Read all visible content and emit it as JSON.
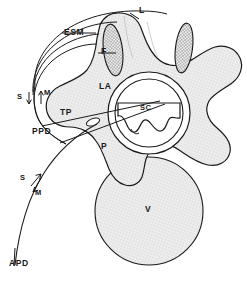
{
  "figure": {
    "type": "anatomical-line-diagram",
    "background_color": "#ffffff",
    "line_color": "#1a1a1a",
    "bone_fill": "#e9e9e9",
    "facet_fill": "#e0e0e0",
    "vertebral_body_fill": "#ebebeb"
  },
  "labels": {
    "esm": "ESM",
    "f": "F",
    "l": "L",
    "la": "LA",
    "tp": "TP",
    "ppd": "PPD",
    "p": "P",
    "sc": "SC",
    "v": "V",
    "apd": "APD",
    "s_upper": "S",
    "m_upper": "M",
    "s_lower": "S",
    "m_lower": "M"
  },
  "structures": [
    {
      "abbr": "ESM",
      "name": "erector spinae muscle"
    },
    {
      "abbr": "F",
      "name": "facet joint"
    },
    {
      "abbr": "L",
      "name": "ligament"
    },
    {
      "abbr": "LA",
      "name": "lamina"
    },
    {
      "abbr": "TP",
      "name": "transverse process"
    },
    {
      "abbr": "P",
      "name": "pedicle"
    },
    {
      "abbr": "SC",
      "name": "spinal canal"
    },
    {
      "abbr": "V",
      "name": "vertebral body"
    },
    {
      "abbr": "PPD",
      "name": "posterior paraspinal approach"
    },
    {
      "abbr": "APD",
      "name": "anterior paraspinal approach"
    },
    {
      "abbr": "S",
      "name": "skin direction marker"
    },
    {
      "abbr": "M",
      "name": "muscle direction marker"
    }
  ]
}
